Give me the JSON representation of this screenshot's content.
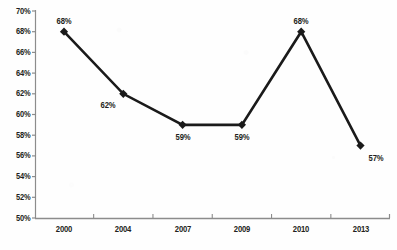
{
  "chart_data": {
    "type": "line",
    "title": "",
    "xlabel": "",
    "ylabel": "",
    "categories": [
      "2000",
      "2004",
      "2007",
      "2009",
      "2010",
      "2013"
    ],
    "values": [
      68,
      62,
      59,
      59,
      68,
      57
    ],
    "point_labels": [
      "68%",
      "62%",
      "59%",
      "59%",
      "68%",
      "57%"
    ],
    "ylim": [
      50,
      70
    ],
    "ytick_step": 2,
    "ytick_labels": [
      "70%",
      "68%",
      "66%",
      "64%",
      "62%",
      "60%",
      "58%",
      "56%",
      "54%",
      "52%",
      "50%"
    ],
    "ytick_values": [
      70,
      68,
      66,
      64,
      62,
      60,
      58,
      56,
      54,
      52,
      50
    ],
    "grid": false,
    "legend": "none",
    "series_name": "",
    "marker": "diamond",
    "line_color": "#1a1a1a",
    "marker_color": "#1a1a1a",
    "axis_color": "#8c8c8c",
    "text_color": "#231f20",
    "background": "#ffffff"
  },
  "label_placement": [
    {
      "category": "2000",
      "position": "above"
    },
    {
      "category": "2004",
      "position": "below-left"
    },
    {
      "category": "2007",
      "position": "below"
    },
    {
      "category": "2009",
      "position": "below"
    },
    {
      "category": "2010",
      "position": "above"
    },
    {
      "category": "2013",
      "position": "below-right"
    }
  ],
  "edge_text": {
    "top_cropped": "",
    "bottom_cropped": ""
  }
}
